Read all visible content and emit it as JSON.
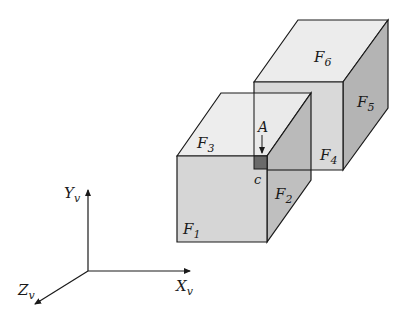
{
  "diagram": {
    "type": "3d-cubes-viewing-coordinates",
    "colors": {
      "top_face": "#ececec",
      "front_face": "#d6d6d6",
      "side_face": "#b4b4b4",
      "back_front_face": "#d9d9d9",
      "overlap_side": "#a6a6a6",
      "pixel_square": "#6a6a6a",
      "stroke": "#1a1a1a"
    },
    "faces": {
      "f1": {
        "base": "F",
        "sub": "1"
      },
      "f2": {
        "base": "F",
        "sub": "2"
      },
      "f3": {
        "base": "F",
        "sub": "3"
      },
      "f4": {
        "base": "F",
        "sub": "4"
      },
      "f5": {
        "base": "F",
        "sub": "5"
      },
      "f6": {
        "base": "F",
        "sub": "6"
      }
    },
    "point_label": "A",
    "pixel_label": "c",
    "axes": {
      "x": {
        "base": "X",
        "sub": "v"
      },
      "y": {
        "base": "Y",
        "sub": "v"
      },
      "z": {
        "base": "Z",
        "sub": "v"
      }
    }
  }
}
